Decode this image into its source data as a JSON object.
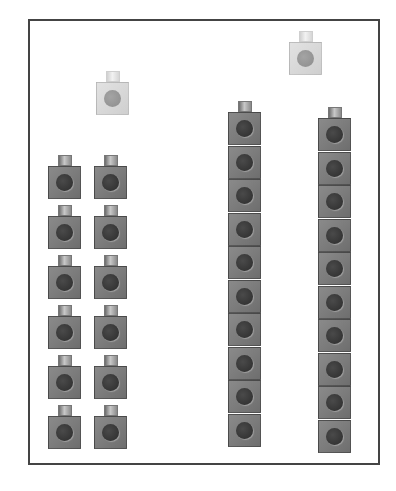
{
  "colors": {
    "dark_cube": "#7c7c7c",
    "dark_dot": "#3a3a3a",
    "light_cube": "#d8d8d8",
    "light_dot": "#999999",
    "frame": "#444444"
  },
  "groups": [
    {
      "name": "loose-column-left",
      "shade": "dark",
      "count": 6,
      "stacked": false
    },
    {
      "name": "loose-column-right",
      "shade": "dark",
      "count": 6,
      "stacked": false
    },
    {
      "name": "tower-middle",
      "shade": "dark",
      "count": 10,
      "stacked": true
    },
    {
      "name": "tower-right",
      "shade": "dark",
      "count": 10,
      "stacked": true
    },
    {
      "name": "single-light-left",
      "shade": "light",
      "count": 1,
      "stacked": false
    },
    {
      "name": "single-light-right",
      "shade": "light",
      "count": 1,
      "stacked": false
    }
  ]
}
